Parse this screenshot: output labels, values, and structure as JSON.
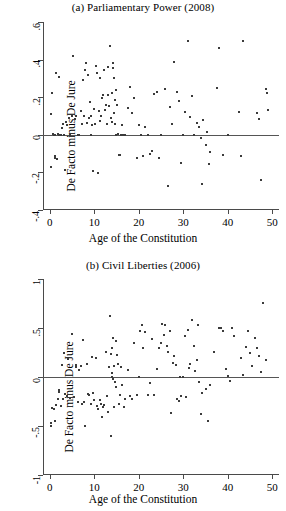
{
  "figure": {
    "background": "#ffffff",
    "point_color": "#3b3b3b",
    "axis_color": "#4a4a4a"
  },
  "chart_data": [
    {
      "type": "scatter",
      "panel": "a",
      "title": "(a) Parliamentary Power (2008)",
      "xlabel": "Age of the Constitution",
      "ylabel": "De Facto minus De Jure",
      "xlim": [
        -1.5,
        51.5
      ],
      "ylim": [
        -0.4,
        0.6
      ],
      "xticks": [
        0,
        10,
        20,
        30,
        40,
        50
      ],
      "xticklabels": [
        "0",
        "10",
        "20",
        "30",
        "40",
        "50"
      ],
      "yticks": [
        -0.4,
        -0.2,
        0,
        0.2,
        0.4,
        0.6
      ],
      "yticklabels": [
        "-.4",
        "-.2",
        "0",
        ".2",
        ".4",
        ".6"
      ],
      "grid": false,
      "legend": null,
      "reference_line": {
        "y": 0,
        "color": "#555555"
      },
      "points": [
        [
          0.3,
          -0.17
        ],
        [
          0.4,
          0.11
        ],
        [
          0.6,
          0.22
        ],
        [
          0.7,
          0.005
        ],
        [
          0.9,
          0.0
        ],
        [
          1.0,
          0.0
        ],
        [
          1.1,
          -0.115
        ],
        [
          1.2,
          0.0
        ],
        [
          1.3,
          -0.125
        ],
        [
          1.5,
          0.33
        ],
        [
          1.6,
          -0.13
        ],
        [
          1.8,
          0.005
        ],
        [
          2.0,
          0.0
        ],
        [
          2.2,
          0.305
        ],
        [
          2.4,
          0.0
        ],
        [
          2.6,
          0.0
        ],
        [
          2.8,
          0.035
        ],
        [
          3.0,
          0.06
        ],
        [
          3.2,
          0.0
        ],
        [
          3.4,
          -0.185
        ],
        [
          3.6,
          0.07
        ],
        [
          4.0,
          0.05
        ],
        [
          4.3,
          0.09
        ],
        [
          4.6,
          0.0
        ],
        [
          5.0,
          0.1
        ],
        [
          5.3,
          0.42
        ],
        [
          5.6,
          0.085
        ],
        [
          6.0,
          0.1
        ],
        [
          6.3,
          0.0
        ],
        [
          6.6,
          0.0
        ],
        [
          7.0,
          0.125
        ],
        [
          7.2,
          0.055
        ],
        [
          7.5,
          0.29
        ],
        [
          7.8,
          0.1
        ],
        [
          8.0,
          0.345
        ],
        [
          8.2,
          0.38
        ],
        [
          8.4,
          0.065
        ],
        [
          8.6,
          0.32
        ],
        [
          8.8,
          0.09
        ],
        [
          9.0,
          0.175
        ],
        [
          9.2,
          0.0
        ],
        [
          9.3,
          0.1
        ],
        [
          9.5,
          0.05
        ],
        [
          9.7,
          -0.19
        ],
        [
          10.0,
          0.135
        ],
        [
          10.2,
          0.06
        ],
        [
          10.4,
          0.365
        ],
        [
          10.6,
          0.33
        ],
        [
          10.8,
          -0.205
        ],
        [
          11.0,
          0.125
        ],
        [
          11.2,
          0.075
        ],
        [
          11.4,
          0.3
        ],
        [
          11.6,
          0.1
        ],
        [
          11.8,
          0.195
        ],
        [
          12.0,
          0.21
        ],
        [
          12.2,
          0.345
        ],
        [
          12.4,
          0.13
        ],
        [
          12.6,
          0.16
        ],
        [
          12.8,
          0.055
        ],
        [
          13.0,
          0.21
        ],
        [
          13.2,
          0.36
        ],
        [
          13.4,
          0.155
        ],
        [
          13.6,
          0.47
        ],
        [
          13.8,
          0.09
        ],
        [
          14.0,
          0.07
        ],
        [
          14.1,
          0.225
        ],
        [
          14.2,
          0.38
        ],
        [
          14.3,
          0.355
        ],
        [
          14.4,
          0.3
        ],
        [
          14.5,
          0.115
        ],
        [
          14.6,
          0.185
        ],
        [
          14.7,
          0.06
        ],
        [
          14.8,
          0.0
        ],
        [
          15.0,
          0.24
        ],
        [
          15.2,
          0.16
        ],
        [
          15.3,
          0.005
        ],
        [
          15.5,
          -0.105
        ],
        [
          15.8,
          -0.11
        ],
        [
          16.0,
          0.0
        ],
        [
          16.2,
          0.05
        ],
        [
          16.5,
          0.0
        ],
        [
          17.0,
          0.0
        ],
        [
          17.5,
          0.145
        ],
        [
          18.0,
          0.255
        ],
        [
          18.5,
          0.115
        ],
        [
          19.0,
          0.195
        ],
        [
          19.5,
          -0.125
        ],
        [
          20.0,
          0.05
        ],
        [
          20.5,
          0.0
        ],
        [
          21.0,
          -0.115
        ],
        [
          21.5,
          0.04
        ],
        [
          22.0,
          0.0
        ],
        [
          22.5,
          -0.1
        ],
        [
          23.0,
          -0.085
        ],
        [
          23.5,
          0.215
        ],
        [
          24.0,
          0.23
        ],
        [
          24.5,
          -0.125
        ],
        [
          25.0,
          0.0
        ],
        [
          26.0,
          0.245
        ],
        [
          26.5,
          -0.27
        ],
        [
          27.0,
          0.15
        ],
        [
          27.5,
          0.055
        ],
        [
          28.0,
          0.385
        ],
        [
          28.5,
          0.23
        ],
        [
          29.0,
          0.18
        ],
        [
          29.5,
          -0.15
        ],
        [
          30.0,
          0.0
        ],
        [
          30.5,
          0.12
        ],
        [
          31.0,
          0.5
        ],
        [
          31.5,
          0.095
        ],
        [
          32.0,
          0.205
        ],
        [
          32.5,
          0.0
        ],
        [
          33.0,
          0.065
        ],
        [
          33.5,
          0.04
        ],
        [
          34.0,
          -0.015
        ],
        [
          34.2,
          -0.26
        ],
        [
          34.5,
          0.08
        ],
        [
          35.0,
          -0.055
        ],
        [
          35.3,
          0.015
        ],
        [
          35.8,
          -0.155
        ],
        [
          36.0,
          -0.09
        ],
        [
          37.5,
          0.25
        ],
        [
          38.0,
          0.46
        ],
        [
          39.0,
          -0.105
        ],
        [
          40.0,
          0.0
        ],
        [
          42.5,
          0.12
        ],
        [
          43.0,
          -0.115
        ],
        [
          43.5,
          0.5
        ],
        [
          46.5,
          0.115
        ],
        [
          47.0,
          0.085
        ],
        [
          47.5,
          -0.24
        ],
        [
          48.5,
          0.245
        ],
        [
          48.7,
          0.225
        ],
        [
          49.0,
          0.13
        ]
      ]
    },
    {
      "type": "scatter",
      "panel": "b",
      "title": "(b) Civil Liberties (2006)",
      "xlabel": "Age of the Constitution",
      "ylabel": "De Facto minus De Jure",
      "xlim": [
        -1.5,
        51.5
      ],
      "ylim": [
        -1.0,
        1.0
      ],
      "xticks": [
        0,
        10,
        20,
        30,
        40,
        50
      ],
      "xticklabels": [
        "0",
        "10",
        "20",
        "30",
        "40",
        "50"
      ],
      "yticks": [
        -1.0,
        -0.5,
        0,
        0.5,
        1.0
      ],
      "yticklabels": [
        "-1",
        "-.5",
        "0",
        ".5",
        "1"
      ],
      "grid": false,
      "legend": null,
      "reference_line": {
        "y": 0,
        "color": "#555555"
      },
      "points": [
        [
          0.2,
          -0.5
        ],
        [
          0.4,
          -0.47
        ],
        [
          0.6,
          -0.32
        ],
        [
          0.9,
          -0.33
        ],
        [
          1.2,
          -0.45
        ],
        [
          1.5,
          -0.29
        ],
        [
          1.8,
          -0.22
        ],
        [
          2.0,
          -0.15
        ],
        [
          2.2,
          -0.13
        ],
        [
          2.5,
          -0.3
        ],
        [
          2.8,
          0.12
        ],
        [
          3.0,
          -0.22
        ],
        [
          3.2,
          0.245
        ],
        [
          3.5,
          -0.17
        ],
        [
          3.8,
          -0.19
        ],
        [
          4.2,
          0.185
        ],
        [
          4.6,
          -0.21
        ],
        [
          5.0,
          0.44
        ],
        [
          5.4,
          -0.2
        ],
        [
          5.8,
          0.105
        ],
        [
          6.0,
          0.12
        ],
        [
          6.3,
          -0.25
        ],
        [
          6.6,
          0.07
        ],
        [
          7.0,
          0.115
        ],
        [
          7.2,
          -0.275
        ],
        [
          7.5,
          0.38
        ],
        [
          7.8,
          -0.26
        ],
        [
          8.0,
          -0.5
        ],
        [
          8.3,
          0.135
        ],
        [
          8.6,
          -0.175
        ],
        [
          8.9,
          -0.18
        ],
        [
          9.2,
          -0.28
        ],
        [
          9.5,
          0.2
        ],
        [
          9.8,
          -0.165
        ],
        [
          10.0,
          -0.23
        ],
        [
          10.3,
          0.195
        ],
        [
          10.6,
          -0.3
        ],
        [
          10.9,
          -0.33
        ],
        [
          11.2,
          -0.23
        ],
        [
          11.5,
          -0.275
        ],
        [
          11.8,
          -0.41
        ],
        [
          12.0,
          -0.31
        ],
        [
          12.3,
          -0.285
        ],
        [
          12.6,
          0.26
        ],
        [
          12.9,
          -0.19
        ],
        [
          13.2,
          -0.36
        ],
        [
          13.4,
          0.105
        ],
        [
          13.6,
          0.625
        ],
        [
          13.7,
          -0.6
        ],
        [
          13.8,
          0.23
        ],
        [
          13.9,
          0.3
        ],
        [
          14.0,
          0.045
        ],
        [
          14.1,
          0.0
        ],
        [
          14.2,
          -0.02
        ],
        [
          14.3,
          0.4
        ],
        [
          14.4,
          -0.31
        ],
        [
          14.5,
          0.115
        ],
        [
          14.6,
          -0.055
        ],
        [
          14.8,
          0.37
        ],
        [
          15.0,
          -0.1
        ],
        [
          15.2,
          0.225
        ],
        [
          15.4,
          0.135
        ],
        [
          15.6,
          -0.28
        ],
        [
          15.8,
          -0.185
        ],
        [
          16.0,
          0.105
        ],
        [
          16.3,
          -0.08
        ],
        [
          16.6,
          -0.305
        ],
        [
          17.0,
          -0.22
        ],
        [
          17.5,
          0.075
        ],
        [
          18.0,
          -0.195
        ],
        [
          18.5,
          -0.22
        ],
        [
          19.0,
          0.35
        ],
        [
          19.5,
          -0.185
        ],
        [
          20.0,
          0.0
        ],
        [
          20.3,
          0.465
        ],
        [
          20.8,
          0.53
        ],
        [
          21.0,
          0.3
        ],
        [
          21.5,
          0.455
        ],
        [
          22.0,
          -0.185
        ],
        [
          22.5,
          -0.06
        ],
        [
          23.0,
          0.39
        ],
        [
          23.5,
          -0.18
        ],
        [
          24.0,
          0.085
        ],
        [
          24.5,
          0.3
        ],
        [
          25.0,
          0.345
        ],
        [
          25.3,
          0.545
        ],
        [
          25.6,
          0.425
        ],
        [
          26.0,
          0.535
        ],
        [
          26.3,
          0.32
        ],
        [
          26.6,
          0.26
        ],
        [
          27.0,
          0.47
        ],
        [
          27.3,
          -0.37
        ],
        [
          27.6,
          0.14
        ],
        [
          28.0,
          0.215
        ],
        [
          28.3,
          0.125
        ],
        [
          28.6,
          -0.225
        ],
        [
          29.0,
          -0.245
        ],
        [
          29.3,
          0.005
        ],
        [
          29.6,
          -0.19
        ],
        [
          30.0,
          0.0
        ],
        [
          30.3,
          0.415
        ],
        [
          30.6,
          -0.2
        ],
        [
          31.0,
          0.475
        ],
        [
          31.3,
          0.095
        ],
        [
          31.6,
          0.135
        ],
        [
          32.0,
          0.58
        ],
        [
          32.3,
          0.32
        ],
        [
          32.6,
          0.06
        ],
        [
          33.0,
          0.175
        ],
        [
          33.3,
          0.53
        ],
        [
          33.6,
          -0.05
        ],
        [
          34.0,
          -0.375
        ],
        [
          34.3,
          -0.16
        ],
        [
          35.0,
          -0.12
        ],
        [
          35.5,
          -0.445
        ],
        [
          36.0,
          -0.08
        ],
        [
          37.0,
          0.255
        ],
        [
          38.0,
          0.5
        ],
        [
          38.5,
          0.5
        ],
        [
          39.0,
          0.465
        ],
        [
          39.5,
          0.08
        ],
        [
          40.0,
          0.015
        ],
        [
          40.5,
          -0.04
        ],
        [
          41.0,
          0.5
        ],
        [
          41.5,
          0.415
        ],
        [
          43.0,
          0.19
        ],
        [
          43.5,
          0.025
        ],
        [
          44.0,
          0.305
        ],
        [
          44.5,
          0.47
        ],
        [
          45.0,
          0.24
        ],
        [
          45.5,
          0.115
        ],
        [
          46.0,
          0.395
        ],
        [
          46.5,
          0.3
        ],
        [
          47.0,
          0.21
        ],
        [
          47.5,
          0.05
        ],
        [
          48.0,
          0.76
        ],
        [
          48.5,
          0.17
        ]
      ]
    }
  ]
}
